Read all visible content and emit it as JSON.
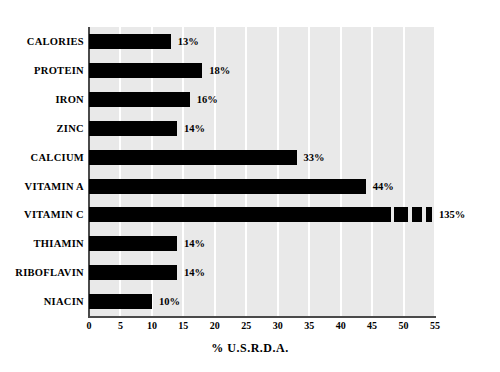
{
  "chart_data": {
    "type": "bar",
    "orientation": "horizontal",
    "title": "",
    "subtitle": "",
    "xlabel": "% U.S.R.D.A.",
    "ylabel": "",
    "categories": [
      "CALORIES",
      "PROTEIN",
      "IRON",
      "ZINC",
      "CALCIUM",
      "VITAMIN A",
      "VITAMIN C",
      "THIAMIN",
      "RIBOFLAVIN",
      "NIACIN"
    ],
    "values": [
      13,
      18,
      16,
      14,
      33,
      44,
      135,
      14,
      14,
      10
    ],
    "data_labels": [
      "13%",
      "18%",
      "16%",
      "14%",
      "33%",
      "44%",
      "135%",
      "14%",
      "14%",
      "10%"
    ],
    "xlim": [
      0,
      55
    ],
    "xticks": [
      0,
      5,
      10,
      15,
      20,
      25,
      30,
      35,
      40,
      45,
      50,
      55
    ],
    "xtick_labels": [
      "0",
      "5",
      "10",
      "15",
      "20",
      "25",
      "30",
      "35",
      "40",
      "45",
      "50",
      "55"
    ],
    "grid": "vertical-white-gridlines",
    "legend": "none",
    "colors": {
      "bar": "#000000",
      "plot_background": "#e9e9e9",
      "gridline": "#ffffff",
      "axis": "#4a4a4a",
      "text": "#000000",
      "page_background": "#ffffff"
    }
  }
}
